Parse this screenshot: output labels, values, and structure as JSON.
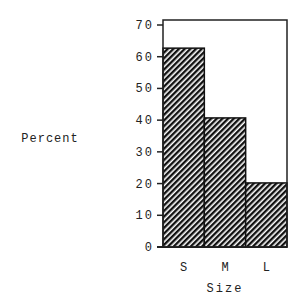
{
  "chart_data": {
    "type": "bar",
    "title": "",
    "xlabel": "Size",
    "ylabel": "Percent",
    "categories": [
      "S",
      "M",
      "L"
    ],
    "values": [
      62.7,
      40.7,
      20.2
    ],
    "ylim": [
      0,
      70
    ],
    "yticks": [
      0,
      10,
      20,
      30,
      40,
      50,
      60,
      70
    ],
    "grid": false,
    "legend": null,
    "bar_fill": "diagonal-hatch",
    "bar_color": "#111111"
  }
}
